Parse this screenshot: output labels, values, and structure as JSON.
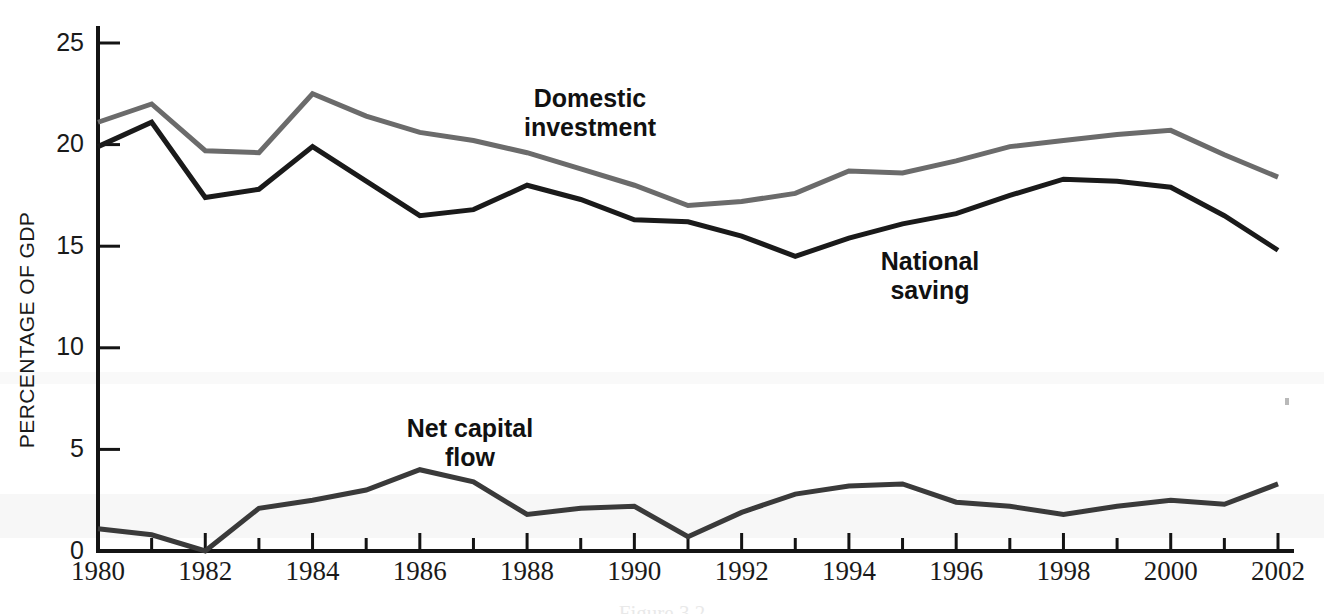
{
  "chart_data": {
    "type": "line",
    "title": "",
    "xlabel": "",
    "ylabel": "PERCENTAGE OF GDP",
    "xlim": [
      1980,
      2002
    ],
    "ylim": [
      0,
      25
    ],
    "ytick_values": [
      0,
      5,
      10,
      15,
      20,
      25
    ],
    "ytick_labels": [
      "0",
      "5",
      "10",
      "15",
      "20",
      "25"
    ],
    "xtick_values": [
      1980,
      1982,
      1984,
      1986,
      1988,
      1990,
      1992,
      1994,
      1996,
      1998,
      2000,
      2002
    ],
    "xtick_labels": [
      "1980",
      "1982",
      "1984",
      "1986",
      "1988",
      "1990",
      "1992",
      "1994",
      "1996",
      "1998",
      "2000",
      "2002"
    ],
    "minor_xticks_every": 1,
    "grid": false,
    "legend_position": "inline-annotations",
    "x": [
      1980,
      1981,
      1982,
      1983,
      1984,
      1985,
      1986,
      1987,
      1988,
      1989,
      1990,
      1991,
      1992,
      1993,
      1994,
      1995,
      1996,
      1997,
      1998,
      1999,
      2000,
      2001,
      2002
    ],
    "series": [
      {
        "name": "Domestic investment",
        "color": "#6b6b6b",
        "stroke_width": 5,
        "values": [
          21.1,
          22.0,
          19.7,
          19.6,
          22.5,
          21.4,
          20.6,
          20.2,
          19.6,
          18.8,
          18.0,
          17.0,
          17.2,
          17.6,
          18.7,
          18.6,
          19.2,
          19.9,
          20.2,
          20.5,
          20.7,
          19.5,
          18.4
        ]
      },
      {
        "name": "National saving",
        "color": "#1a1a1a",
        "stroke_width": 5,
        "values": [
          19.9,
          21.1,
          17.4,
          17.8,
          19.9,
          18.2,
          16.5,
          16.8,
          18.0,
          17.3,
          16.3,
          16.2,
          15.5,
          14.5,
          15.4,
          16.1,
          16.6,
          17.5,
          18.3,
          18.2,
          17.9,
          16.5,
          14.8
        ]
      },
      {
        "name": "Net capital flow",
        "color": "#3a3a3a",
        "stroke_width": 5,
        "values": [
          1.1,
          0.8,
          0.0,
          2.1,
          2.5,
          3.0,
          4.0,
          3.4,
          1.8,
          2.1,
          2.2,
          0.7,
          1.9,
          2.8,
          3.2,
          3.3,
          2.4,
          2.2,
          1.8,
          2.2,
          2.5,
          2.3,
          3.3
        ]
      }
    ],
    "annotations": [
      {
        "name": "domestic-investment",
        "lines": [
          "Domestic",
          "investment"
        ],
        "x_px": 590,
        "y_px": 107
      },
      {
        "name": "national-saving",
        "lines": [
          "National",
          "saving"
        ],
        "x_px": 930,
        "y_px": 270
      },
      {
        "name": "net-capital-flow",
        "lines": [
          "Net capital",
          "flow"
        ],
        "x_px": 470,
        "y_px": 437
      }
    ]
  },
  "caption": {
    "text": "Figure 3.2"
  }
}
